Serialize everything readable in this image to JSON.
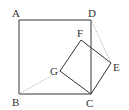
{
  "diagram": {
    "colors": {
      "stroke": "#333333",
      "dotted": "#9a9a9a",
      "background": "#ffffff"
    },
    "points": {
      "A": {
        "label": "A",
        "x": 19,
        "y": 20
      },
      "B": {
        "label": "B",
        "x": 19,
        "y": 94
      },
      "C": {
        "label": "C",
        "x": 91,
        "y": 94
      },
      "D": {
        "label": "D",
        "x": 91,
        "y": 20
      },
      "E": {
        "label": "E",
        "x": 111,
        "y": 63
      },
      "F": {
        "label": "F",
        "x": 81,
        "y": 40
      },
      "G": {
        "label": "G",
        "x": 60,
        "y": 71
      }
    },
    "labels": [
      {
        "text": "A",
        "x": 12,
        "y": 17
      },
      {
        "text": "D",
        "x": 88,
        "y": 17
      },
      {
        "text": "F",
        "x": 77,
        "y": 37
      },
      {
        "text": "G",
        "x": 50,
        "y": 75
      },
      {
        "text": "E",
        "x": 113,
        "y": 71
      },
      {
        "text": "B",
        "x": 12,
        "y": 106
      },
      {
        "text": "C",
        "x": 86,
        "y": 107
      }
    ],
    "solid_segments": [
      "AB",
      "BC",
      "CD",
      "DA",
      "CE",
      "EF",
      "FG",
      "GC"
    ],
    "dotted_segments": [
      "BG",
      "DE"
    ]
  }
}
